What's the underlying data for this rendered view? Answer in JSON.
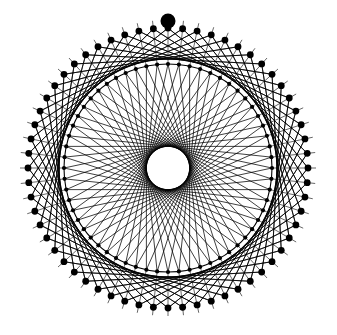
{
  "canvas": {
    "width": 337,
    "height": 335,
    "background_color": "#ffffff",
    "ink_color": "#000000",
    "title": "String Art Rosette"
  },
  "figure": {
    "type": "string-art-rosette",
    "center_x": 168,
    "center_y": 168,
    "inner_ring_radius": 104,
    "outer_ring_radius": 140,
    "central_hole_radius": 23,
    "node_count": 60,
    "chord_step": 26,
    "outer_spoke_step": 13,
    "inner_node_dot_radius": 2.1,
    "outer_node_dot_radius": 3.4,
    "highlight_node_index": 0,
    "highlight_node_radius": 7.5,
    "highlight_node_x": 168,
    "highlight_node_y": 21,
    "chord_stroke_width": 0.75,
    "outer_stroke_width": 0.75,
    "main_circle_stroke_width": 1.1,
    "start_angle_degrees": -90
  },
  "chart_data": {
    "type": "scatter",
    "subtitle": "",
    "xlabel": "",
    "ylabel": "",
    "xlim": [
      0,
      337
    ],
    "ylim": [
      0,
      335
    ],
    "grid": false,
    "legend": "none",
    "annotations": [
      "Large filled marker at top of outer ring"
    ],
    "series": [
      {
        "name": "inner-ring-nodes",
        "count": 60,
        "radius": 104,
        "center": [
          168,
          168
        ],
        "marker": "filled-circle",
        "marker_size": 2.1,
        "color": "#000000"
      },
      {
        "name": "outer-ring-nodes",
        "count": 60,
        "radius": 140,
        "center": [
          168,
          168
        ],
        "marker": "filled-circle",
        "marker_size": 3.4,
        "color": "#000000"
      },
      {
        "name": "inner-chords",
        "count": 60,
        "step": 26,
        "color": "#000000",
        "stroke_width": 0.75
      },
      {
        "name": "outer-lattice-chords",
        "count": 120,
        "step": 13,
        "color": "#000000",
        "stroke_width": 0.75
      },
      {
        "name": "radial-spokes",
        "count": 60,
        "color": "#000000",
        "stroke_width": 0.6
      },
      {
        "name": "highlight-marker",
        "count": 1,
        "position": [
          168,
          21
        ],
        "marker": "filled-circle",
        "marker_size": 7.5,
        "color": "#000000"
      }
    ]
  }
}
